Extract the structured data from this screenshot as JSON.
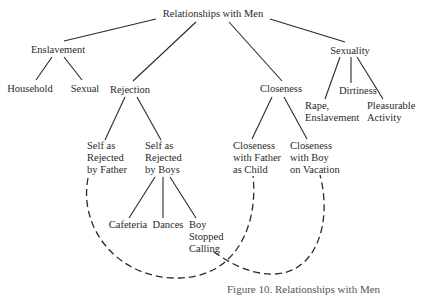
{
  "diagram": {
    "root": "Relationships with Men",
    "level1": {
      "enslavement": "Enslavement",
      "rejection": "Rejection",
      "closeness": "Closeness",
      "sexuality": "Sexuality"
    },
    "enslavement_children": {
      "household": "Household",
      "sexual": "Sexual"
    },
    "sexuality_children": {
      "rape_line1": "Rape,",
      "rape_line2": "Enslavement",
      "dirtiness": "Dirtiness",
      "pleasurable_line1": "Pleasurable",
      "pleasurable_line2": "Activity"
    },
    "rejection_children": {
      "father_line1": "Self as",
      "father_line2": "Rejected",
      "father_line3": "by Father",
      "boys_line1": "Self as",
      "boys_line2": "Rejected",
      "boys_line3": "by Boys"
    },
    "boys_children": {
      "cafeteria": "Cafeteria",
      "dances": "Dances",
      "stopped_line1": "Boy",
      "stopped_line2": "Stopped",
      "stopped_line3": "Calling"
    },
    "closeness_children": {
      "father_line1": "Closeness",
      "father_line2": "with Father",
      "father_line3": "as Child",
      "boy_line1": "Closeness",
      "boy_line2": "with Boy",
      "boy_line3": "on Vacation"
    },
    "connections": [
      {
        "from": "Self as Rejected by Father",
        "to": "Closeness with Father as Child",
        "style": "dashed"
      },
      {
        "from": "Boy Stopped Calling",
        "to": "Closeness with Boy on Vacation",
        "style": "dashed"
      }
    ],
    "caption": "Figure 10.  Relationships with Men"
  }
}
